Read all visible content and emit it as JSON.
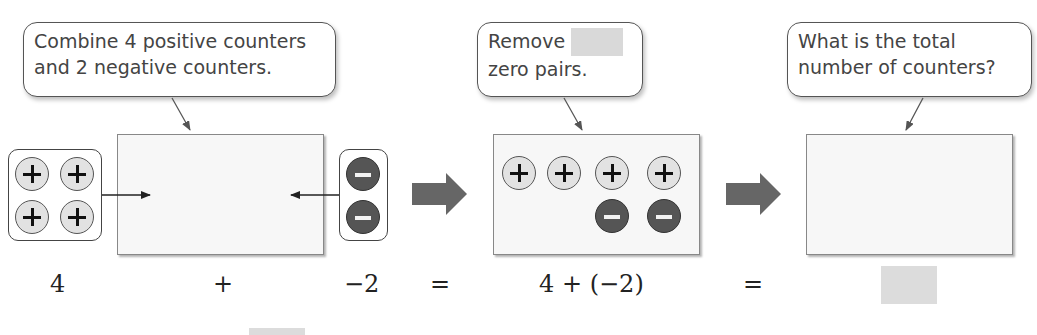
{
  "callouts": [
    {
      "line1": "Combine 4 positive counters",
      "line2": "and 2 negative counters."
    },
    {
      "line1": "Remove",
      "line2": "zero pairs.",
      "masked": true
    },
    {
      "line1": "What is the total",
      "line2": "number of counters?"
    }
  ],
  "equation": {
    "term1": "4",
    "plus": "+",
    "term2": "−2",
    "equals1": "=",
    "expression": "4 + (−2)",
    "equals2": "=",
    "result_masked": true
  },
  "counters": {
    "left_group": {
      "sign": "positive",
      "count": 4
    },
    "right_group": {
      "sign": "negative",
      "count": 2
    },
    "middle_box": {
      "positive": 4,
      "negative": 2
    },
    "final_box": {
      "positive": 0,
      "negative": 0
    }
  },
  "colors": {
    "positive_fill": "#e2e2e2",
    "negative_fill": "#555555",
    "arrow": "#666666",
    "mask": "#d9d9d9"
  }
}
